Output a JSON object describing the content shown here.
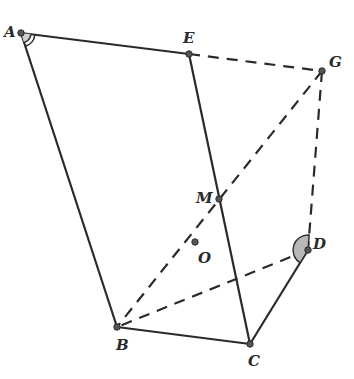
{
  "diagram": {
    "type": "geometry",
    "points": {
      "A": {
        "label": "A",
        "x": 21,
        "y": 33,
        "lx": 4,
        "ly": 37
      },
      "E": {
        "label": "E",
        "x": 189,
        "y": 54,
        "lx": 183,
        "ly": 43
      },
      "G": {
        "label": "G",
        "x": 322,
        "y": 71,
        "lx": 329,
        "ly": 67
      },
      "M": {
        "label": "M",
        "x": 219,
        "y": 199,
        "lx": 196,
        "ly": 203
      },
      "O": {
        "label": "O",
        "x": 195,
        "y": 242,
        "lx": 198,
        "ly": 263
      },
      "D": {
        "label": "D",
        "x": 308,
        "y": 250,
        "lx": 313,
        "ly": 249
      },
      "B": {
        "label": "B",
        "x": 117,
        "y": 327,
        "lx": 116,
        "ly": 350
      },
      "C": {
        "label": "C",
        "x": 250,
        "y": 344,
        "lx": 248,
        "ly": 366
      }
    },
    "solid_segments": [
      [
        "A",
        "E"
      ],
      [
        "E",
        "C"
      ],
      [
        "A",
        "B"
      ],
      [
        "B",
        "C"
      ],
      [
        "C",
        "D"
      ]
    ],
    "dashed_segments": [
      [
        "E",
        "G"
      ],
      [
        "G",
        "B"
      ],
      [
        "G",
        "D"
      ],
      [
        "D",
        "B"
      ]
    ],
    "angle_marks": [
      {
        "vertex": "A",
        "style": "double-arc",
        "note": "angle BAE marked"
      },
      {
        "vertex": "D",
        "style": "shaded-sector",
        "note": "angle GDC marked"
      }
    ],
    "colors": {
      "stroke": "#2a2a2a",
      "point": "#555555",
      "shade": "#b8b8b8"
    }
  }
}
